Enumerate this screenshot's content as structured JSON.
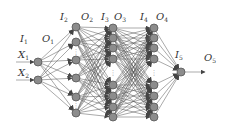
{
  "diagram": {
    "type": "neural-network",
    "colors": {
      "node": "#8c8c8c",
      "node_stroke": "#555555",
      "edge": "#555555",
      "text": "#333333"
    },
    "inputs": [
      {
        "label": "X",
        "sub": "1",
        "x": 38,
        "y": 62
      },
      {
        "label": "X",
        "sub": "2",
        "x": 38,
        "y": 80
      }
    ],
    "layers": [
      {
        "name": "layer-1",
        "x": 38,
        "nodes": [
          62,
          80
        ],
        "dots": []
      },
      {
        "name": "layer-2",
        "x": 76,
        "nodes": [
          27,
          42,
          60,
          78,
          97,
          113
        ],
        "dots": [
          51,
          105
        ]
      },
      {
        "name": "layer-3",
        "x": 113,
        "nodes": [
          28,
          38,
          48,
          59,
          85,
          96,
          107,
          117
        ],
        "dots": [
          72
        ]
      },
      {
        "name": "layer-4",
        "x": 154,
        "nodes": [
          28,
          38,
          48,
          59,
          85,
          96,
          107,
          117
        ],
        "dots": [
          72
        ]
      },
      {
        "name": "layer-5",
        "x": 181,
        "nodes": [
          72
        ],
        "dots": []
      }
    ],
    "labels": [
      {
        "main": "I",
        "sub": "1",
        "x": 20,
        "y": 42
      },
      {
        "main": "O",
        "sub": "1",
        "x": 42,
        "y": 42
      },
      {
        "main": "I",
        "sub": "2",
        "x": 60,
        "y": 20
      },
      {
        "main": "O",
        "sub": "2",
        "x": 81,
        "y": 20
      },
      {
        "main": "I",
        "sub": "3",
        "x": 101,
        "y": 20
      },
      {
        "main": "O",
        "sub": "3",
        "x": 114,
        "y": 20
      },
      {
        "main": "I",
        "sub": "4",
        "x": 140,
        "y": 20
      },
      {
        "main": "O",
        "sub": "4",
        "x": 156,
        "y": 20
      },
      {
        "main": "I",
        "sub": "5",
        "x": 175,
        "y": 58
      },
      {
        "main": "O",
        "sub": "5",
        "x": 204,
        "y": 61
      }
    ],
    "output_arrow": {
      "x1": 185,
      "y1": 72,
      "x2": 205,
      "y2": 72
    }
  }
}
